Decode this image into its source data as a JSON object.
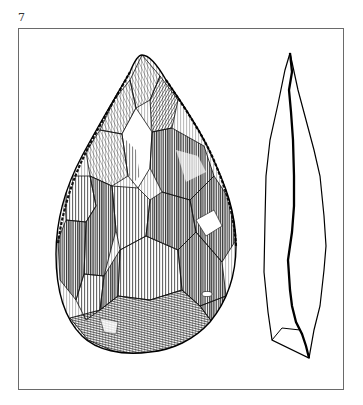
{
  "figure": {
    "number": "7",
    "views": [
      {
        "name": "face-view",
        "label": "Front face of hand axe"
      },
      {
        "name": "profile-view",
        "label": "Side profile of hand axe"
      }
    ]
  },
  "colors": {
    "background": "#ffffff",
    "frame": "#6a6a6a",
    "ink": "#111111"
  }
}
